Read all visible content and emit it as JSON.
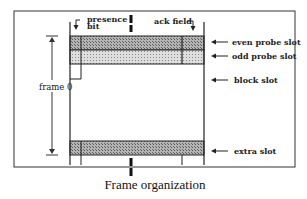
{
  "diagram": {
    "caption": "Frame organization",
    "frame_label": "frame 0",
    "top_labels": {
      "presence_line1": "presence",
      "presence_line2": "bit",
      "ack": "ack field"
    },
    "slots": [
      {
        "id": "even",
        "label": "even probe slot",
        "fill": "#9a9a9a"
      },
      {
        "id": "odd",
        "label": "odd probe slot",
        "fill": "#c8c8c8"
      },
      {
        "id": "block",
        "label": "block slot",
        "fill": "#ffffff"
      },
      {
        "id": "extra",
        "label": "extra slot",
        "fill": "#a8a8a8"
      }
    ],
    "arrow_glyph": "←"
  }
}
